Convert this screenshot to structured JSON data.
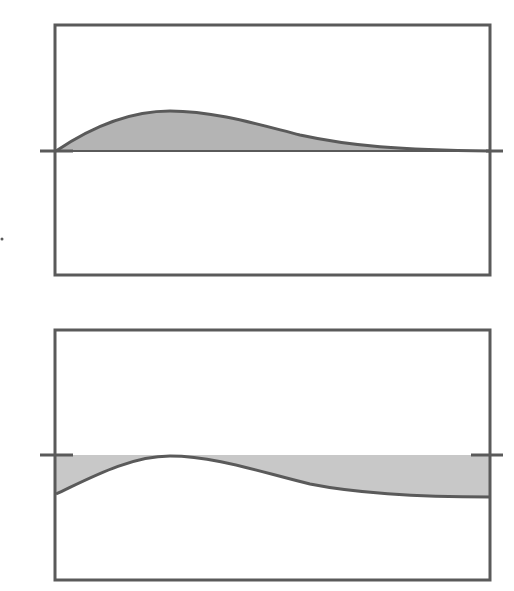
{
  "colors": {
    "frame": "#5a5a5a",
    "curve": "#5a5a5a",
    "fill_top": "#b4b4b4",
    "fill_bottom": "#c8c8c8",
    "background": "#ffffff"
  },
  "panels": [
    {
      "id": "top",
      "description": "Positive pulse above baseline, decaying to zero on the right",
      "frame": {
        "x": 55,
        "y": 25,
        "w": 435,
        "h": 250
      },
      "baseline_y": 151,
      "left_tick": {
        "x1": 40,
        "x2": 73
      },
      "right_tick": {
        "x1": 486,
        "x2": 503
      },
      "curve_path": "M56,151 C90,128 130,111 170,111 C215,111 260,125 300,135 C350,146 400,150 490,151",
      "fill_path": "M56,151 C90,128 130,111 170,111 C215,111 260,125 300,135 C350,146 400,150 490,151 L490,151 L56,151 Z"
    },
    {
      "id": "bottom",
      "description": "Curve below baseline with shaded region between baseline and curve",
      "frame": {
        "x": 55,
        "y": 330,
        "w": 435,
        "h": 250
      },
      "baseline_y": 455,
      "left_tick": {
        "x1": 40,
        "x2": 73
      },
      "right_tick": {
        "x1": 471,
        "x2": 503
      },
      "curve_path": "M56,494 C90,478 130,456 170,456 C215,456 260,472 310,484 C360,494 420,497 490,497",
      "fill_path": "M56,455 L490,455 L490,497 C420,497 360,494 310,484 C260,472 215,456 170,456 C130,456 90,478 56,494 Z"
    }
  ],
  "margin_mark": {
    "x": 2,
    "y": 239
  }
}
